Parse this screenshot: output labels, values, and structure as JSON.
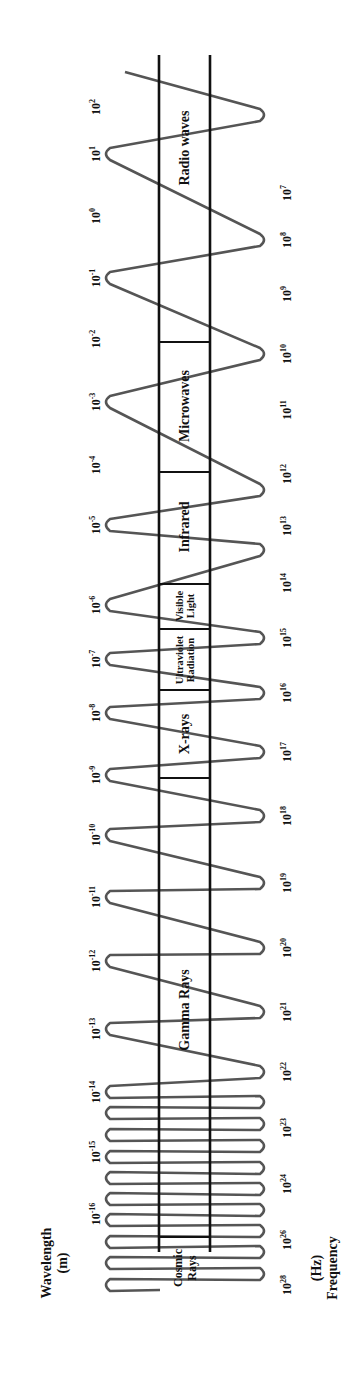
{
  "axes": {
    "wavelength": {
      "label": "Wavelength",
      "unit": "(m)"
    },
    "frequency": {
      "label": "Frequency",
      "unit": "(Hz)"
    }
  },
  "wavelength_ticks": [
    {
      "base": "10",
      "exp": "2",
      "y": 107
    },
    {
      "base": "10",
      "exp": "1",
      "y": 154
    },
    {
      "base": "10",
      "exp": "0",
      "y": 216
    },
    {
      "base": "10",
      "exp": "-1",
      "y": 278
    },
    {
      "base": "10",
      "exp": "-2",
      "y": 339
    },
    {
      "base": "10",
      "exp": "-3",
      "y": 402
    },
    {
      "base": "10",
      "exp": "-4",
      "y": 465
    },
    {
      "base": "10",
      "exp": "-5",
      "y": 525
    },
    {
      "base": "10",
      "exp": "-6",
      "y": 605
    },
    {
      "base": "10",
      "exp": "-7",
      "y": 659
    },
    {
      "base": "10",
      "exp": "-8",
      "y": 713
    },
    {
      "base": "10",
      "exp": "-9",
      "y": 775
    },
    {
      "base": "10",
      "exp": "-10",
      "y": 835
    },
    {
      "base": "10",
      "exp": "-11",
      "y": 897
    },
    {
      "base": "10",
      "exp": "-12",
      "y": 961
    },
    {
      "base": "10",
      "exp": "-13",
      "y": 1029
    },
    {
      "base": "10",
      "exp": "-14",
      "y": 1092
    },
    {
      "base": "10",
      "exp": "-15",
      "y": 1152
    },
    {
      "base": "10",
      "exp": "-16",
      "y": 1214
    }
  ],
  "frequency_ticks": [
    {
      "base": "10",
      "exp": "7",
      "y": 193
    },
    {
      "base": "10",
      "exp": "8",
      "y": 240
    },
    {
      "base": "10",
      "exp": "9",
      "y": 294
    },
    {
      "base": "10",
      "exp": "10",
      "y": 354
    },
    {
      "base": "10",
      "exp": "11",
      "y": 410
    },
    {
      "base": "10",
      "exp": "12",
      "y": 474
    },
    {
      "base": "10",
      "exp": "13",
      "y": 526
    },
    {
      "base": "10",
      "exp": "14",
      "y": 583
    },
    {
      "base": "10",
      "exp": "15",
      "y": 638
    },
    {
      "base": "10",
      "exp": "16",
      "y": 693
    },
    {
      "base": "10",
      "exp": "17",
      "y": 752
    },
    {
      "base": "10",
      "exp": "18",
      "y": 816
    },
    {
      "base": "10",
      "exp": "19",
      "y": 883
    },
    {
      "base": "10",
      "exp": "20",
      "y": 948
    },
    {
      "base": "10",
      "exp": "21",
      "y": 1012
    },
    {
      "base": "10",
      "exp": "22",
      "y": 1072
    },
    {
      "base": "10",
      "exp": "23",
      "y": 1128
    },
    {
      "base": "10",
      "exp": "24",
      "y": 1184
    },
    {
      "base": "10",
      "exp": "26",
      "y": 1240
    },
    {
      "base": "10",
      "exp": "28",
      "y": 1285
    }
  ],
  "bands": [
    {
      "name": "Radio waves",
      "y_start": 55,
      "y_end": 342
    },
    {
      "name": "Microwaves",
      "y_start": 342,
      "y_end": 472
    },
    {
      "name": "Infrared",
      "y_start": 472,
      "y_end": 584
    },
    {
      "name": "Visible Light",
      "line1": "Visible",
      "line2": "Light",
      "y_start": 584,
      "y_end": 629
    },
    {
      "name": "Ultraviolet Radiation",
      "line1": "Ultraviolet",
      "line2": "Radiation",
      "y_start": 629,
      "y_end": 690
    },
    {
      "name": "X-rays",
      "y_start": 690,
      "y_end": 778
    },
    {
      "name": "Gamma Rays",
      "y_start": 778,
      "y_end": 1237
    },
    {
      "name": "Cosmic Rays",
      "line1": "Cosmic",
      "line2": "Rays",
      "y_start": 1237,
      "y_end": 1250
    }
  ],
  "colors": {
    "ink": "#111111",
    "wave": "#555555",
    "background": "#ffffff"
  }
}
